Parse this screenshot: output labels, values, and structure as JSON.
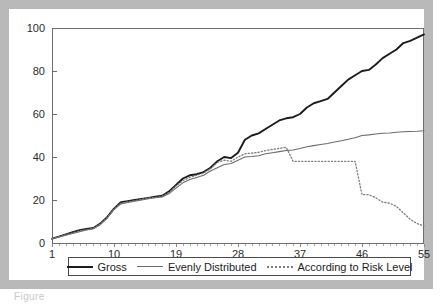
{
  "figure": {
    "caption_fragment": "Figure"
  },
  "legend": {
    "entries": [
      {
        "label": "Gross",
        "style": "solid-thick",
        "color": "#1c1c1c"
      },
      {
        "label": "Evenly Distributed",
        "style": "solid-thin",
        "color": "#6b6b6b"
      },
      {
        "label": "According to Risk Level",
        "style": "dotted",
        "color": "#7c7c7c"
      }
    ]
  },
  "chart_data": {
    "type": "line",
    "title": "",
    "xlabel": "",
    "ylabel": "",
    "xlim": [
      1,
      55
    ],
    "ylim": [
      0,
      100
    ],
    "grid": false,
    "legend_position": "below-axis",
    "xticks": [
      1,
      10,
      19,
      28,
      37,
      46,
      55
    ],
    "yticks": [
      0,
      20,
      40,
      60,
      80,
      100
    ],
    "x": [
      1,
      2,
      3,
      4,
      5,
      6,
      7,
      8,
      9,
      10,
      11,
      12,
      13,
      14,
      15,
      16,
      17,
      18,
      19,
      20,
      21,
      22,
      23,
      24,
      25,
      26,
      27,
      28,
      29,
      30,
      31,
      32,
      33,
      34,
      35,
      36,
      37,
      38,
      39,
      40,
      41,
      42,
      43,
      44,
      45,
      46,
      47,
      48,
      49,
      50,
      51,
      52,
      53,
      54,
      55
    ],
    "series": [
      {
        "name": "Gross",
        "color": "#1c1c1c",
        "style": "solid-thick",
        "values": [
          2,
          3,
          4,
          5,
          6,
          6.5,
          7,
          9,
          12,
          16,
          19,
          19.5,
          20,
          20.5,
          21,
          21.5,
          22,
          24,
          27,
          30,
          31.5,
          32,
          33,
          35,
          38,
          40,
          39.5,
          42,
          48,
          50,
          51,
          53,
          55,
          57,
          58,
          58.5,
          60,
          63,
          65,
          66,
          67,
          70,
          73,
          76,
          78,
          80,
          80.5,
          83,
          86,
          88,
          90,
          93,
          94,
          95.5,
          97
        ]
      },
      {
        "name": "Evenly Distributed",
        "color": "#6b6b6b",
        "style": "solid-thin",
        "values": [
          2,
          2.8,
          3.6,
          4.4,
          5.2,
          6,
          6.6,
          8.5,
          11.5,
          15.5,
          18.2,
          18.8,
          19.4,
          20,
          20.6,
          21,
          21.4,
          23,
          25.5,
          28,
          29.5,
          30.5,
          31.5,
          33.5,
          35,
          36.5,
          37,
          38.5,
          40,
          40.2,
          40.6,
          41.5,
          42,
          42.5,
          43,
          43.3,
          44,
          44.8,
          45.3,
          45.8,
          46.3,
          47,
          47.6,
          48.3,
          49,
          50,
          50.3,
          50.7,
          51,
          51.2,
          51.5,
          51.7,
          51.9,
          52,
          52.2
        ]
      },
      {
        "name": "According to Risk Level",
        "color": "#7c7c7c",
        "style": "dotted",
        "values": [
          2,
          2.9,
          3.8,
          4.7,
          5.6,
          6.2,
          6.8,
          8.8,
          11.8,
          15.8,
          18.5,
          19.1,
          19.7,
          20.3,
          20.9,
          21.2,
          21.7,
          23.5,
          26.5,
          29,
          30.5,
          31.5,
          32.5,
          34.5,
          37.5,
          38.5,
          38,
          40,
          41.5,
          41.8,
          42.2,
          43,
          43.5,
          44,
          44.5,
          38,
          38,
          38,
          38,
          38,
          38,
          38,
          38,
          38,
          38,
          22.5,
          22.5,
          21,
          19,
          18.5,
          17,
          14,
          11,
          9,
          8
        ]
      }
    ]
  }
}
